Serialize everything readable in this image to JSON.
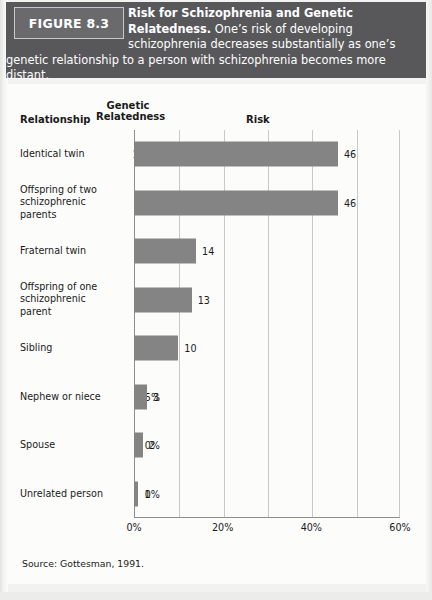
{
  "figure": {
    "tag": "FIGURE 8.3",
    "caption_lead": "Risk for Schizophrenia and Genetic Relatedness.",
    "caption_rest": " One’s risk of developing schizophrenia decreases substantially as one’s genetic relationship to a person with schizophrenia becomes more distant.",
    "source": "Source: Gottesman, 1991."
  },
  "columns": {
    "relationship": "Relationship",
    "genetic_relatedness": "Genetic Relatedness",
    "genetic_line1": "Genetic",
    "genetic_line2": "Relatedness",
    "risk": "Risk"
  },
  "colors": {
    "header_bg": "#58585a",
    "figure_tag_bg": "#6a6a6c",
    "bar": "#848484",
    "panel_bg": "#fcfcfb",
    "axis": "#8d8d8d",
    "gridline": "#c9c9c9"
  },
  "chart_data": {
    "type": "bar",
    "orientation": "horizontal",
    "title": "Risk for Schizophrenia and Genetic Relatedness",
    "xlabel": "Risk",
    "ylabel": "Relationship",
    "xlim": [
      0,
      60
    ],
    "xticks": [
      0,
      20,
      40,
      60
    ],
    "xtick_labels": [
      "0%",
      "20%",
      "40%",
      "60%"
    ],
    "gridlines": [
      0,
      10,
      20,
      30,
      40,
      50,
      60
    ],
    "grid": true,
    "legend": "none",
    "unit": "%",
    "categories": [
      "Identical twin",
      "Offspring of two schizophrenic parents",
      "Fraternal twin",
      "Offspring of one schizophrenic parent",
      "Sibling",
      "Nephew or niece",
      "Spouse",
      "Unrelated person"
    ],
    "values": [
      46,
      46,
      14,
      13,
      10,
      3,
      2,
      1
    ],
    "genetic_relatedness": [
      "100%",
      "50%",
      "50%",
      "50%",
      "50%",
      "25%",
      "0%",
      "0%"
    ],
    "rows": [
      {
        "label": "Identical twin",
        "label_lines": [
          "Identical twin"
        ],
        "relatedness": "100%",
        "value": 46,
        "value_label": "46"
      },
      {
        "label": "Offspring of two schizophrenic parents",
        "label_lines": [
          "Offspring of two",
          "schizophrenic",
          "parents"
        ],
        "relatedness": "50%",
        "value": 46,
        "value_label": "46"
      },
      {
        "label": "Fraternal twin",
        "label_lines": [
          "Fraternal twin"
        ],
        "relatedness": "50%",
        "value": 14,
        "value_label": "14"
      },
      {
        "label": "Offspring of one schizophrenic parent",
        "label_lines": [
          "Offspring of one",
          "schizophrenic",
          "parent"
        ],
        "relatedness": "50%",
        "value": 13,
        "value_label": "13"
      },
      {
        "label": "Sibling",
        "label_lines": [
          "Sibling"
        ],
        "relatedness": "50%",
        "value": 10,
        "value_label": "10"
      },
      {
        "label": "Nephew or niece",
        "label_lines": [
          "Nephew or niece"
        ],
        "relatedness": "25%",
        "value": 3,
        "value_label": "3"
      },
      {
        "label": "Spouse",
        "label_lines": [
          "Spouse"
        ],
        "relatedness": "0%",
        "value": 2,
        "value_label": "2"
      },
      {
        "label": "Unrelated person",
        "label_lines": [
          "Unrelated person"
        ],
        "relatedness": "0%",
        "value": 1,
        "value_label": "1"
      }
    ]
  }
}
